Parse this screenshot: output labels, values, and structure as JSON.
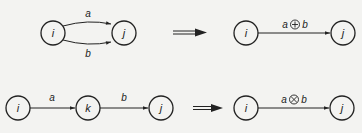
{
  "rules": [
    {
      "name": "parallel",
      "before": {
        "nodes": [
          {
            "id": "i",
            "label": "i"
          },
          {
            "id": "j",
            "label": "j"
          }
        ],
        "edges": [
          {
            "from": "i",
            "to": "j",
            "label": "a"
          },
          {
            "from": "i",
            "to": "j",
            "label": "b"
          }
        ]
      },
      "after": {
        "nodes": [
          {
            "id": "i",
            "label": "i"
          },
          {
            "id": "j",
            "label": "j"
          }
        ],
        "edge": {
          "from": "i",
          "to": "j",
          "left": "a",
          "op": "⊕",
          "right": "b"
        }
      }
    },
    {
      "name": "series",
      "before": {
        "nodes": [
          {
            "id": "i",
            "label": "i"
          },
          {
            "id": "k",
            "label": "k"
          },
          {
            "id": "j",
            "label": "j"
          }
        ],
        "edges": [
          {
            "from": "i",
            "to": "k",
            "label": "a"
          },
          {
            "from": "k",
            "to": "j",
            "label": "b"
          }
        ]
      },
      "after": {
        "nodes": [
          {
            "id": "i",
            "label": "i"
          },
          {
            "id": "j",
            "label": "j"
          }
        ],
        "edge": {
          "from": "i",
          "to": "j",
          "left": "a",
          "op": "⊗",
          "right": "b"
        }
      }
    }
  ],
  "implies_symbol": "⟹"
}
